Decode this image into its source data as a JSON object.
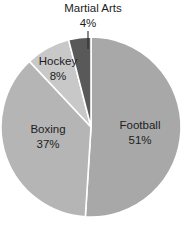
{
  "chart_data": {
    "type": "pie",
    "title": "",
    "subtitle": "",
    "xlabel": "",
    "ylabel": "",
    "legend_position": "none",
    "grid": false,
    "value_unit": "%",
    "start_angle_deg": 0,
    "direction": "clockwise",
    "categories": [
      "Football",
      "Boxing",
      "Hockey",
      "Martial Arts"
    ],
    "values": [
      51,
      37,
      8,
      4
    ],
    "slices": [
      {
        "name": "Football",
        "label": "Football",
        "value": 51,
        "value_label": "51%",
        "color": "#a8a8a8",
        "label_placement": "inside",
        "start_deg": 0,
        "end_deg": 183.6
      },
      {
        "name": "Boxing",
        "label": "Boxing",
        "value": 37,
        "value_label": "37%",
        "color": "#b5b5b5",
        "label_placement": "inside",
        "start_deg": 183.6,
        "end_deg": 316.8
      },
      {
        "name": "Hockey",
        "label": "Hockey",
        "value": 8,
        "value_label": "8%",
        "color": "#c8c8c8",
        "label_placement": "inside",
        "start_deg": 316.8,
        "end_deg": 345.6
      },
      {
        "name": "Martial Arts",
        "label": "Martial Arts",
        "value": 4,
        "value_label": "4%",
        "color": "#595959",
        "label_placement": "outside-top",
        "start_deg": 345.6,
        "end_deg": 360
      }
    ]
  },
  "labels": {
    "football_name": "Football",
    "football_value": "51%",
    "boxing_name": "Boxing",
    "boxing_value": "37%",
    "hockey_name": "Hockey",
    "hockey_value": "8%",
    "martial_arts_name": "Martial Arts",
    "martial_arts_value": "4%"
  },
  "style": {
    "background": "#ffffff",
    "separator_color": "#ffffff",
    "text_color": "#1d1d1d",
    "leader_color": "#2b2b2b"
  }
}
